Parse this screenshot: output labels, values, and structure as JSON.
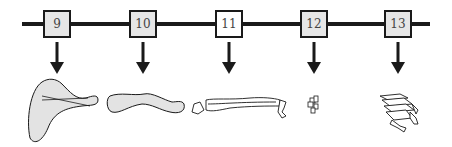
{
  "diagram": {
    "type": "developmental-sequence",
    "stages": [
      {
        "label": "9",
        "x": 43,
        "fill": "#e6e6e6",
        "bone_stage": "cartilaginous condensation, large paddle"
      },
      {
        "label": "10",
        "x": 129,
        "fill": "#e6e6e6",
        "bone_stage": "elongated rod"
      },
      {
        "label": "11",
        "x": 215,
        "fill": "#ffffff",
        "bone_stage": "paired long bones with small distal elements"
      },
      {
        "label": "12",
        "x": 300,
        "fill": "#e6e6e6",
        "bone_stage": "small isolated elements"
      },
      {
        "label": "13",
        "x": 384,
        "fill": "#e6e6e6",
        "bone_stage": "digit-like stacked elements"
      }
    ],
    "line_color": "#1a1a1a",
    "box_fill_shaded": "#e6e6e6",
    "bone_fill": "#e3e3e3"
  }
}
